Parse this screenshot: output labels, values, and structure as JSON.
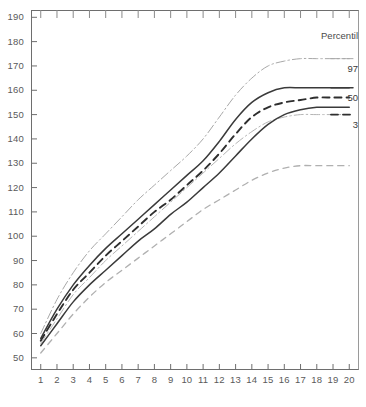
{
  "chart_data": {
    "type": "line",
    "title": "",
    "subtitle": "",
    "xlabel": "",
    "ylabel": "",
    "xlim": [
      0.4,
      20.6
    ],
    "ylim": [
      45,
      193
    ],
    "grid": false,
    "legend_position": "top-right",
    "legend_title": "Percentil",
    "y_ticks": [
      50,
      60,
      70,
      80,
      90,
      100,
      110,
      120,
      130,
      140,
      150,
      160,
      170,
      180,
      190
    ],
    "x_ticks": [
      1,
      2,
      3,
      4,
      5,
      6,
      7,
      8,
      9,
      10,
      11,
      12,
      13,
      14,
      15,
      16,
      17,
      18,
      19,
      20
    ],
    "x": [
      1,
      2,
      3,
      4,
      5,
      6,
      7,
      8,
      9,
      10,
      11,
      12,
      13,
      14,
      15,
      16,
      17,
      18,
      19,
      20
    ],
    "annotations": [
      {
        "text": "97",
        "x": 20.6,
        "y": 173
      },
      {
        "text": "50",
        "x": 20.6,
        "y": 161
      },
      {
        "text": "3",
        "x": 20.6,
        "y": 150
      }
    ],
    "series": [
      {
        "name": "97",
        "style": "dash-dot",
        "color": "#a8a8a8",
        "width": 1.0,
        "values": [
          60,
          74,
          85,
          94,
          101,
          108,
          115,
          121,
          127,
          133,
          140,
          149,
          158,
          165,
          170,
          172,
          173,
          173,
          173,
          173
        ]
      },
      {
        "name": "50",
        "style": "solid",
        "color": "#3a3a3a",
        "width": 1.5,
        "values": [
          58,
          70,
          80,
          88,
          95,
          101,
          107,
          113,
          119,
          125,
          131,
          139,
          148,
          155,
          159,
          161,
          161,
          161,
          161,
          161
        ]
      },
      {
        "name": "3",
        "style": "dashed",
        "color": "#2e2e2e",
        "width": 1.9,
        "values": [
          57,
          68,
          78,
          85,
          92,
          98,
          104,
          110,
          115,
          121,
          127,
          134,
          142,
          149,
          153,
          155,
          156,
          157,
          157,
          157
        ]
      },
      {
        "name": "97-lower",
        "style": "dash-dot",
        "color": "#b5b5b5",
        "width": 1.0,
        "values": [
          56,
          66,
          76,
          83,
          90,
          96,
          102,
          108,
          114,
          120,
          126,
          132,
          138,
          143,
          147,
          149,
          150,
          150,
          150,
          150
        ]
      },
      {
        "name": "50-lower",
        "style": "solid",
        "color": "#3a3a3a",
        "width": 1.5,
        "values": [
          55,
          64,
          73,
          80,
          86,
          92,
          98,
          103,
          109,
          114,
          120,
          126,
          133,
          140,
          146,
          150,
          152,
          153,
          153,
          153
        ]
      },
      {
        "name": "3-lower",
        "style": "dashed",
        "color": "#b0b0b0",
        "width": 1.3,
        "values": [
          52,
          60,
          68,
          75,
          81,
          86,
          91,
          96,
          101,
          106,
          111,
          115,
          119,
          123,
          126,
          128,
          129,
          129,
          129,
          129
        ]
      }
    ]
  }
}
